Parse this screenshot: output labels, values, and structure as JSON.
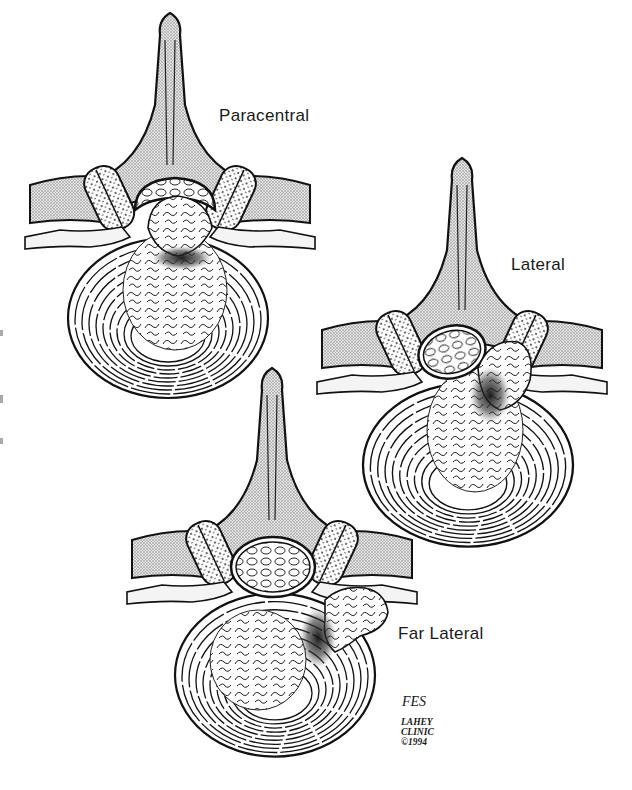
{
  "figure": {
    "labels": {
      "paracentral": "Paracentral",
      "lateral": "Lateral",
      "far_lateral": "Far Lateral"
    },
    "credit": {
      "signature": "FES",
      "line1": "LAHEY",
      "line2": "CLINIC",
      "line3": "©1994"
    },
    "colors": {
      "line": "#111111",
      "bone_fill": "#cfcfcf",
      "background": "#ffffff"
    }
  }
}
